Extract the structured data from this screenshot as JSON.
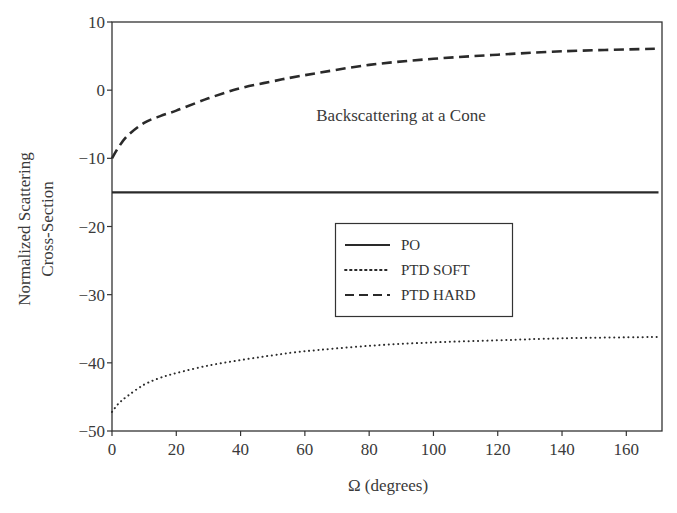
{
  "chart_data": {
    "type": "line",
    "title": "Backscattering at a Cone",
    "xlabel": "Ω (degrees)",
    "ylabel": [
      "Normalized Scattering",
      "Cross-Section"
    ],
    "xlim": [
      0,
      170
    ],
    "ylim": [
      -50,
      10
    ],
    "x_ticks": [
      0,
      20,
      40,
      60,
      80,
      100,
      120,
      140,
      160
    ],
    "y_ticks": [
      10,
      0,
      -10,
      -20,
      -30,
      -40,
      -50
    ],
    "y_tick_labels": [
      "10",
      "0",
      "−10",
      "−20",
      "−30",
      "−40",
      "−50"
    ],
    "grid": false,
    "legend_position": "center",
    "series": [
      {
        "name": "PO",
        "style": "solid",
        "x": [
          0,
          170
        ],
        "values": [
          -15,
          -15
        ]
      },
      {
        "name": "PTD SOFT",
        "style": "dotted",
        "x": [
          0,
          2,
          5,
          10,
          15,
          20,
          30,
          40,
          50,
          60,
          80,
          100,
          120,
          140,
          170
        ],
        "values": [
          -47.2,
          -46.0,
          -44.8,
          -43.2,
          -42.2,
          -41.5,
          -40.4,
          -39.6,
          -38.9,
          -38.3,
          -37.5,
          -37.0,
          -36.7,
          -36.4,
          -36.2
        ]
      },
      {
        "name": "PTD HARD",
        "style": "dashed",
        "x": [
          0,
          2,
          5,
          10,
          15,
          20,
          30,
          40,
          50,
          60,
          80,
          100,
          120,
          140,
          170
        ],
        "values": [
          -10,
          -8.4,
          -6.6,
          -4.8,
          -3.8,
          -3.0,
          -1.2,
          0.3,
          1.3,
          2.2,
          3.7,
          4.6,
          5.2,
          5.7,
          6.1
        ]
      }
    ]
  },
  "colors": {
    "axis": "#333333",
    "line": "#2a2a2a",
    "background": "#ffffff"
  }
}
